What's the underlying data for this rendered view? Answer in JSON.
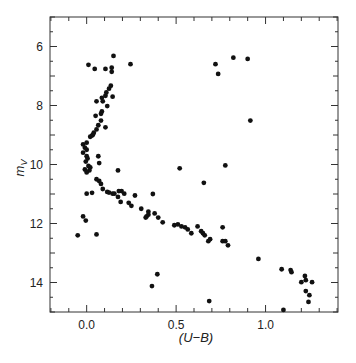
{
  "chart_data": {
    "type": "scatter",
    "title": "",
    "xlabel": "(U−B)",
    "ylabel": "m_V",
    "ylabel_main": "m",
    "ylabel_sub": "V",
    "xlim": [
      -0.205,
      1.405
    ],
    "ylim": [
      15.0,
      5.0
    ],
    "y_inverted": true,
    "grid": false,
    "legend": null,
    "x_ticks_major": [
      0.0,
      0.5,
      1.0
    ],
    "x_tick_labels": [
      "0.0",
      "0.5",
      "1.0"
    ],
    "x_ticks_minor_step": 0.1,
    "y_ticks_major": [
      6,
      8,
      10,
      12,
      14
    ],
    "y_tick_labels": [
      "6",
      "8",
      "10",
      "12",
      "14"
    ],
    "y_ticks_minor_step": 0.5,
    "marker_color": "#111111",
    "points": [
      [
        0.15,
        6.32
      ],
      [
        0.01,
        6.62
      ],
      [
        0.045,
        6.76
      ],
      [
        0.105,
        6.76
      ],
      [
        0.14,
        6.72
      ],
      [
        0.14,
        6.86
      ],
      [
        0.245,
        6.6
      ],
      [
        0.135,
        7.33
      ],
      [
        0.125,
        7.43
      ],
      [
        0.11,
        7.56
      ],
      [
        0.105,
        7.67
      ],
      [
        0.145,
        7.7
      ],
      [
        0.085,
        7.74
      ],
      [
        0.055,
        7.86
      ],
      [
        0.09,
        7.86
      ],
      [
        0.115,
        8.02
      ],
      [
        0.085,
        8.2
      ],
      [
        0.08,
        8.28
      ],
      [
        0.05,
        8.35
      ],
      [
        0.08,
        8.51
      ],
      [
        0.065,
        8.67
      ],
      [
        0.105,
        8.74
      ],
      [
        0.055,
        8.81
      ],
      [
        0.04,
        8.92
      ],
      [
        0.03,
        9.02
      ],
      [
        0.02,
        9.06
      ],
      [
        0.035,
        8.99
      ],
      [
        -0.02,
        9.32
      ],
      [
        0.0,
        9.26
      ],
      [
        -0.01,
        9.43
      ],
      [
        -0.02,
        9.6
      ],
      [
        0.0,
        9.72
      ],
      [
        0.065,
        9.72
      ],
      [
        0.005,
        9.8
      ],
      [
        0.07,
        9.95
      ],
      [
        -0.01,
        10.17
      ],
      [
        0.015,
        10.2
      ],
      [
        0.0,
        10.27
      ],
      [
        0.175,
        10.2
      ],
      [
        0.02,
        10.1
      ],
      [
        0.01,
        10.05
      ],
      [
        -0.005,
        9.9
      ],
      [
        0.0,
        9.5
      ],
      [
        0.055,
        10.5
      ],
      [
        0.07,
        10.56
      ],
      [
        0.08,
        10.66
      ],
      [
        0.09,
        10.83
      ],
      [
        0.03,
        10.96
      ],
      [
        0.0,
        10.99
      ],
      [
        0.115,
        10.93
      ],
      [
        0.145,
        10.99
      ],
      [
        0.195,
        10.9
      ],
      [
        0.21,
        10.99
      ],
      [
        0.125,
        10.95
      ],
      [
        0.155,
        10.99
      ],
      [
        0.18,
        10.9
      ],
      [
        0.175,
        11.1
      ],
      [
        0.19,
        11.27
      ],
      [
        0.27,
        11.05
      ],
      [
        0.37,
        11.0
      ],
      [
        0.235,
        11.3
      ],
      [
        0.25,
        11.4
      ],
      [
        0.305,
        11.5
      ],
      [
        0.345,
        11.6
      ],
      [
        0.38,
        11.66
      ],
      [
        0.335,
        11.76
      ],
      [
        0.4,
        11.8
      ],
      [
        0.425,
        11.96
      ],
      [
        0.33,
        11.8
      ],
      [
        0.345,
        11.7
      ],
      [
        0.49,
        12.06
      ],
      [
        0.51,
        12.03
      ],
      [
        0.53,
        12.1
      ],
      [
        0.55,
        12.13
      ],
      [
        0.565,
        12.2
      ],
      [
        0.585,
        12.33
      ],
      [
        0.62,
        12.1
      ],
      [
        0.64,
        12.26
      ],
      [
        0.65,
        12.33
      ],
      [
        0.66,
        12.4
      ],
      [
        0.69,
        12.53
      ],
      [
        0.68,
        12.6
      ],
      [
        0.76,
        12.13
      ],
      [
        0.76,
        12.6
      ],
      [
        0.775,
        12.6
      ],
      [
        0.79,
        12.74
      ],
      [
        0.96,
        13.2
      ],
      [
        0.72,
        6.6
      ],
      [
        0.735,
        6.93
      ],
      [
        0.82,
        6.38
      ],
      [
        0.9,
        6.42
      ],
      [
        0.915,
        8.51
      ],
      [
        0.775,
        10.03
      ],
      [
        0.655,
        10.62
      ],
      [
        0.52,
        10.13
      ],
      [
        -0.02,
        11.76
      ],
      [
        -0.005,
        11.9
      ],
      [
        -0.05,
        12.4
      ],
      [
        0.055,
        12.37
      ],
      [
        0.395,
        13.72
      ],
      [
        0.365,
        14.12
      ],
      [
        1.09,
        13.55
      ],
      [
        1.14,
        13.58
      ],
      [
        1.145,
        13.65
      ],
      [
        1.22,
        13.78
      ],
      [
        1.225,
        13.92
      ],
      [
        1.2,
        13.99
      ],
      [
        1.26,
        13.99
      ],
      [
        1.225,
        14.29
      ],
      [
        1.245,
        14.43
      ],
      [
        1.24,
        14.66
      ],
      [
        1.1,
        14.93
      ],
      [
        0.685,
        14.63
      ]
    ]
  },
  "axes": {
    "x_label": "(U−B)",
    "y_label_main": "m",
    "y_label_sub": "V"
  }
}
